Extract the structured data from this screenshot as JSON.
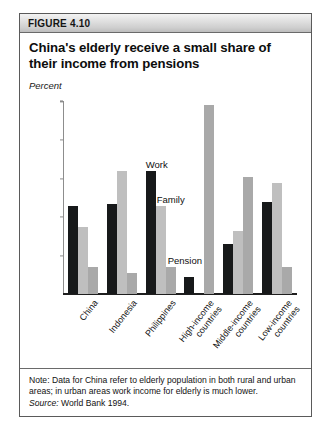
{
  "figure": {
    "number_label": "FIGURE 4.10",
    "title": "China's elderly receive a small share of their income from pensions",
    "axis_unit_label": "Percent",
    "note": "Note: Data for China refer to elderly population in both rural and urban areas; in urban areas work income for elderly is much lower.",
    "source_prefix": "Source:",
    "source_text": " World Bank 1994."
  },
  "series_annotations": {
    "work": "Work",
    "family": "Family",
    "pension": "Pension"
  },
  "colors": {
    "work": "#17191a",
    "family": "#bfbfbf",
    "pension": "#a9a9a9",
    "border": "#5a5a5a",
    "header_band": "#cfcfcf"
  },
  "chart_data": {
    "type": "bar",
    "title": "China's elderly receive a small share of their income from pensions",
    "xlabel": "",
    "ylabel": "Percent",
    "ylim": [
      0,
      100
    ],
    "yticks": [
      0,
      20,
      40,
      60,
      80,
      100
    ],
    "ytick_labels": [
      "0",
      "20",
      "40",
      "60",
      "80",
      "100"
    ],
    "grid": false,
    "legend_position": "inline-annotations",
    "categories": [
      "China",
      "Indonesia",
      "Philippines",
      "High-income countries",
      "Middle-income countries",
      "Low-income countries"
    ],
    "category_lines": [
      [
        "China"
      ],
      [
        "Indonesia"
      ],
      [
        "Philippines"
      ],
      [
        "High-income",
        "countries"
      ],
      [
        "Middle-income",
        "countries"
      ],
      [
        "Low-income",
        "countries"
      ]
    ],
    "series": [
      {
        "name": "Work",
        "color": "#17191a",
        "values": [
          46,
          47,
          64,
          9,
          26,
          48
        ]
      },
      {
        "name": "Family",
        "color": "#bfbfbf",
        "values": [
          35,
          64,
          46,
          0,
          33,
          58
        ]
      },
      {
        "name": "Pension",
        "color": "#a9a9a9",
        "values": [
          14,
          11,
          14,
          98,
          61,
          14
        ]
      }
    ]
  }
}
